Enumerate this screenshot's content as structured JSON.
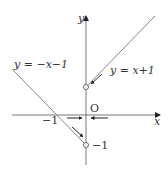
{
  "diagram": {
    "axes": {
      "x_label": "x",
      "y_label": "y",
      "origin_label": "O"
    },
    "tick_labels": {
      "x_neg_one": "−1",
      "y_neg_one": "−1"
    },
    "curves": [
      {
        "label": "y = −x−1",
        "equation": "y = -x - 1",
        "domain": "x < 0"
      },
      {
        "label": "y = x+1",
        "equation": "y = x + 1",
        "domain": "x > 0"
      }
    ],
    "open_points": [
      {
        "x": 0,
        "y": 1
      },
      {
        "x": 0,
        "y": -1
      }
    ],
    "colors": {
      "line": "#888888",
      "axis": "#777777",
      "arrow": "#222222",
      "text": "#333333"
    }
  }
}
